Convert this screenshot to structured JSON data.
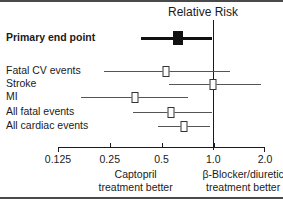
{
  "chart_data": {
    "type": "forest",
    "title": "Relative Risk",
    "xlabel": "",
    "ylabel": "",
    "xscale": "log",
    "xlim": [
      0.125,
      2.0
    ],
    "xticks": [
      0.125,
      0.25,
      0.5,
      1.0,
      2.0
    ],
    "xticklabels": [
      "0.125",
      "0.25",
      "0.5",
      "1.0",
      "2.0"
    ],
    "reference_line": 1.0,
    "grid": false,
    "legend": "none",
    "left_footer": "Captopril treatment better",
    "right_footer": "β-Blocker/diuretic treatment better",
    "categories": [
      "Primary end point",
      "Fatal CV events",
      "Stroke",
      "MI",
      "All fatal events",
      "All cardiac events"
    ],
    "rows": [
      {
        "label": "Primary end point",
        "estimate": 0.62,
        "ci_low": 0.38,
        "ci_high": 0.98,
        "marker": "filled-square",
        "emphasis": "bold"
      },
      {
        "label": "Fatal CV events",
        "estimate": 0.53,
        "ci_low": 0.23,
        "ci_high": 1.25,
        "marker": "open-square",
        "emphasis": "normal"
      },
      {
        "label": "Stroke",
        "estimate": 1.0,
        "ci_low": 0.55,
        "ci_high": 1.9,
        "marker": "open-square",
        "emphasis": "normal"
      },
      {
        "label": "MI",
        "estimate": 0.35,
        "ci_low": 0.17,
        "ci_high": 0.71,
        "marker": "open-square",
        "emphasis": "normal"
      },
      {
        "label": "All fatal events",
        "estimate": 0.57,
        "ci_low": 0.34,
        "ci_high": 0.99,
        "marker": "open-square",
        "emphasis": "normal"
      },
      {
        "label": "All cardiac events",
        "estimate": 0.68,
        "ci_low": 0.48,
        "ci_high": 0.96,
        "marker": "open-square",
        "emphasis": "normal"
      }
    ]
  },
  "colors": {
    "axis": "#1a1a1a",
    "ci": "#555555",
    "primary_ci": "#111111",
    "marker_fill": "#ffffff",
    "marker_edge": "#333333",
    "frame": "#4a4a4a",
    "background": "#ffffff"
  },
  "labels": {
    "title": "Relative Risk",
    "footer_left_line1": "Captopril",
    "footer_left_line2": "treatment better",
    "footer_right_line1": "β-Blocker/diuretic",
    "footer_right_line2": "treatment better"
  }
}
